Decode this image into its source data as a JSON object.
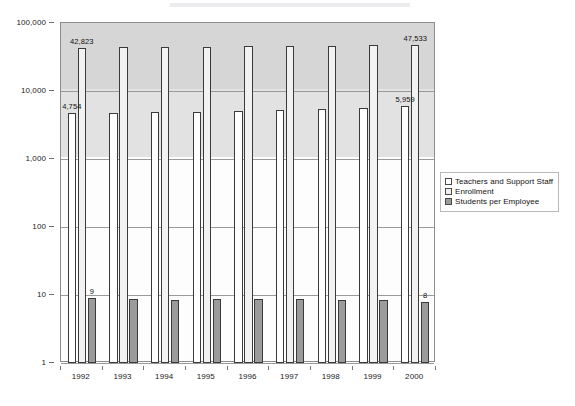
{
  "chart_data": {
    "type": "bar",
    "title": "",
    "subtitle": "",
    "xlabel": "",
    "ylabel": "",
    "yscale": "log",
    "ylim": [
      1,
      100000
    ],
    "ytick_labels": [
      "100,000",
      "10,000",
      "1,000",
      "100",
      "10",
      "1"
    ],
    "ytick_values": [
      100000,
      10000,
      1000,
      100,
      10,
      1
    ],
    "grid": true,
    "legend_position": "right",
    "categories": [
      "1992",
      "1993",
      "1994",
      "1995",
      "1996",
      "1997",
      "1998",
      "1999",
      "2000"
    ],
    "series": [
      {
        "name": "Teachers and Support Staff",
        "color": "#ffffff",
        "values": [
          4754,
          4800,
          4880,
          4950,
          5080,
          5200,
          5400,
          5600,
          5959
        ]
      },
      {
        "name": "Enrollment",
        "color": "#f2f2f2",
        "values": [
          42823,
          43800,
          44600,
          45200,
          45800,
          46200,
          46600,
          47000,
          47533
        ]
      },
      {
        "name": "Students per Employee",
        "color": "#9b9b9b",
        "values": [
          9,
          8.8,
          8.6,
          8.7,
          8.8,
          8.7,
          8.6,
          8.6,
          8
        ]
      }
    ],
    "annotations": [
      {
        "series": "Enrollment",
        "category": "1992",
        "text": "42,823"
      },
      {
        "series": "Teachers and Support Staff",
        "category": "1992",
        "text": "4,754"
      },
      {
        "series": "Students per Employee",
        "category": "1992",
        "text": "9"
      },
      {
        "series": "Enrollment",
        "category": "2000",
        "text": "47,533"
      },
      {
        "series": "Teachers and Support Staff",
        "category": "2000",
        "text": "5,959"
      },
      {
        "series": "Students per Employee",
        "category": "2000",
        "text": "8"
      }
    ]
  },
  "legend": {
    "items": [
      {
        "label": "Teachers and Support Staff",
        "swatch": "legend-swatch-white"
      },
      {
        "label": "Enrollment",
        "swatch": "legend-swatch-lightgray"
      },
      {
        "label": "Students per Employee",
        "swatch": "legend-swatch-darkgray"
      }
    ]
  },
  "axes": {
    "y_labels": [
      "100,000",
      "10,000",
      "1,000",
      "100",
      "10",
      "1"
    ],
    "x_labels": [
      "1992",
      "1993",
      "1994",
      "1995",
      "1996",
      "1997",
      "1998",
      "1999",
      "2000"
    ]
  }
}
